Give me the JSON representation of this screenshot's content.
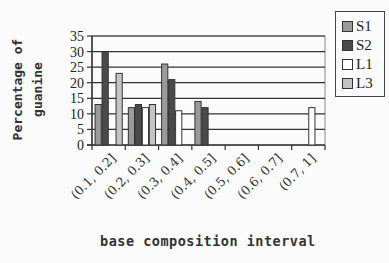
{
  "chart_data": {
    "type": "bar",
    "title": "",
    "xlabel": "base composition interval",
    "ylabel": "Percentage of guanine",
    "ylim": [
      0,
      35
    ],
    "yticks": [
      0,
      5,
      10,
      15,
      20,
      25,
      30,
      35
    ],
    "grid": true,
    "legend_position": "right",
    "categories": [
      "(0.1, 0.2]",
      "(0.2, 0.3]",
      "(0.3, 0.4]",
      "(0.4, 0.5]",
      "(0.5, 0.6]",
      "(0.6, 0.7]",
      "(0.7, 1]"
    ],
    "series": [
      {
        "name": "S1",
        "color": "#9a9a9a",
        "values": [
          13,
          12,
          26,
          14,
          0,
          0,
          0
        ]
      },
      {
        "name": "S2",
        "color": "#4a4a4a",
        "values": [
          30,
          13,
          21,
          12,
          0,
          0,
          0
        ]
      },
      {
        "name": "L1",
        "color": "#ffffff",
        "values": [
          0,
          12,
          11,
          0,
          0,
          0,
          12
        ]
      },
      {
        "name": "L3",
        "color": "#c4c4c4",
        "values": [
          23,
          13,
          0,
          0,
          0,
          0,
          0
        ]
      }
    ]
  },
  "labels": {
    "ylabel_line1": "Percentage of",
    "ylabel_line2": "guanine",
    "xlabel": "base composition interval"
  },
  "legend": [
    {
      "name": "S1",
      "color": "#9a9a9a"
    },
    {
      "name": "S2",
      "color": "#4a4a4a"
    },
    {
      "name": "L1",
      "color": "#ffffff"
    },
    {
      "name": "L3",
      "color": "#c4c4c4"
    }
  ]
}
